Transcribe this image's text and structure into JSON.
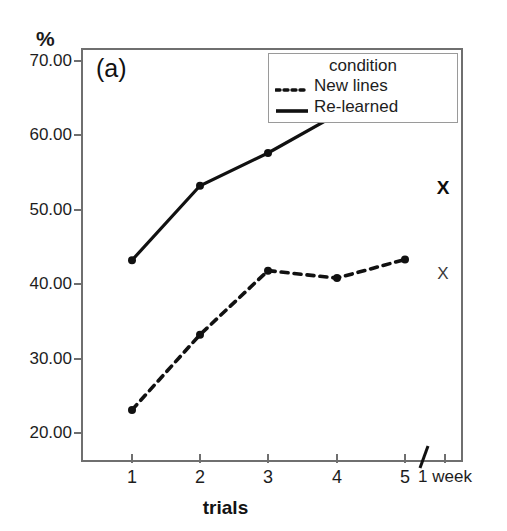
{
  "chart_data": {
    "type": "line",
    "title": "",
    "panel_label": "(a)",
    "xlabel": "trials",
    "ylabel": "%",
    "ylim": [
      16.1,
      71.7
    ],
    "yticks": [
      "20.00",
      "30.00",
      "40.00",
      "50.00",
      "60.00",
      "70.00"
    ],
    "ytick_values": [
      20,
      30,
      40,
      50,
      60,
      70
    ],
    "categories": [
      "1",
      "2",
      "3",
      "4",
      "5",
      "1 week"
    ],
    "xtick_labels": [
      "1",
      "2",
      "3",
      "4",
      "5",
      "1 week"
    ],
    "axis_break": true,
    "grid": false,
    "legend_position": "top-right",
    "series": [
      {
        "name": "New lines",
        "style": "dashed",
        "marker": "filled-circle",
        "color": "#111111",
        "x": [
          "1",
          "2",
          "3",
          "4",
          "5"
        ],
        "values": [
          23.1,
          33.2,
          41.8,
          40.8,
          43.3
        ]
      },
      {
        "name": "Re-learned",
        "style": "solid",
        "marker": "filled-circle",
        "color": "#111111",
        "x": [
          "1",
          "2",
          "3",
          "4",
          "5"
        ],
        "values": [
          43.2,
          53.2,
          57.6,
          62.8,
          63.3
        ]
      }
    ],
    "annotations": [
      {
        "text": "X",
        "series": "Re-learned",
        "x": "1 week",
        "value": 53.0,
        "weight": "bold"
      },
      {
        "text": "X",
        "series": "New lines",
        "x": "1 week",
        "value": 41.5,
        "weight": "normal"
      }
    ]
  },
  "legend": {
    "title": "condition",
    "entries": [
      {
        "label": "New lines"
      },
      {
        "label": "Re-learned"
      }
    ]
  },
  "axes": {
    "y_unit": "%",
    "x_title": "trials",
    "panel_label": "(a)"
  },
  "colors": {
    "frame": "#6f6f6f",
    "ink": "#111111",
    "background": "#ffffff"
  }
}
